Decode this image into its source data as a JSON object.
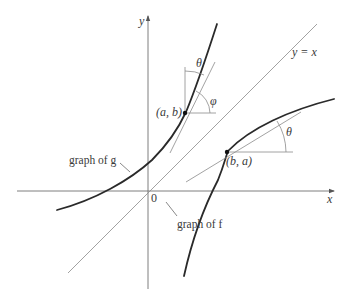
{
  "figure": {
    "axes": {
      "x_label": "x",
      "y_label": "y",
      "origin_label": "0"
    },
    "diagonal": {
      "label": "y = x"
    },
    "curves": {
      "g": {
        "label": "graph of g"
      },
      "f": {
        "label": "graph of f"
      }
    },
    "points": {
      "p_ab": {
        "label": "(a, b)"
      },
      "p_ba": {
        "label": "(b, a)"
      }
    },
    "angles": {
      "theta_top": "θ",
      "phi": "φ",
      "theta_right": "θ"
    },
    "colors": {
      "curve": "#2a2a2a",
      "axis": "#707070",
      "guide": "#8a8a8a",
      "text": "#3a3a3a"
    }
  }
}
